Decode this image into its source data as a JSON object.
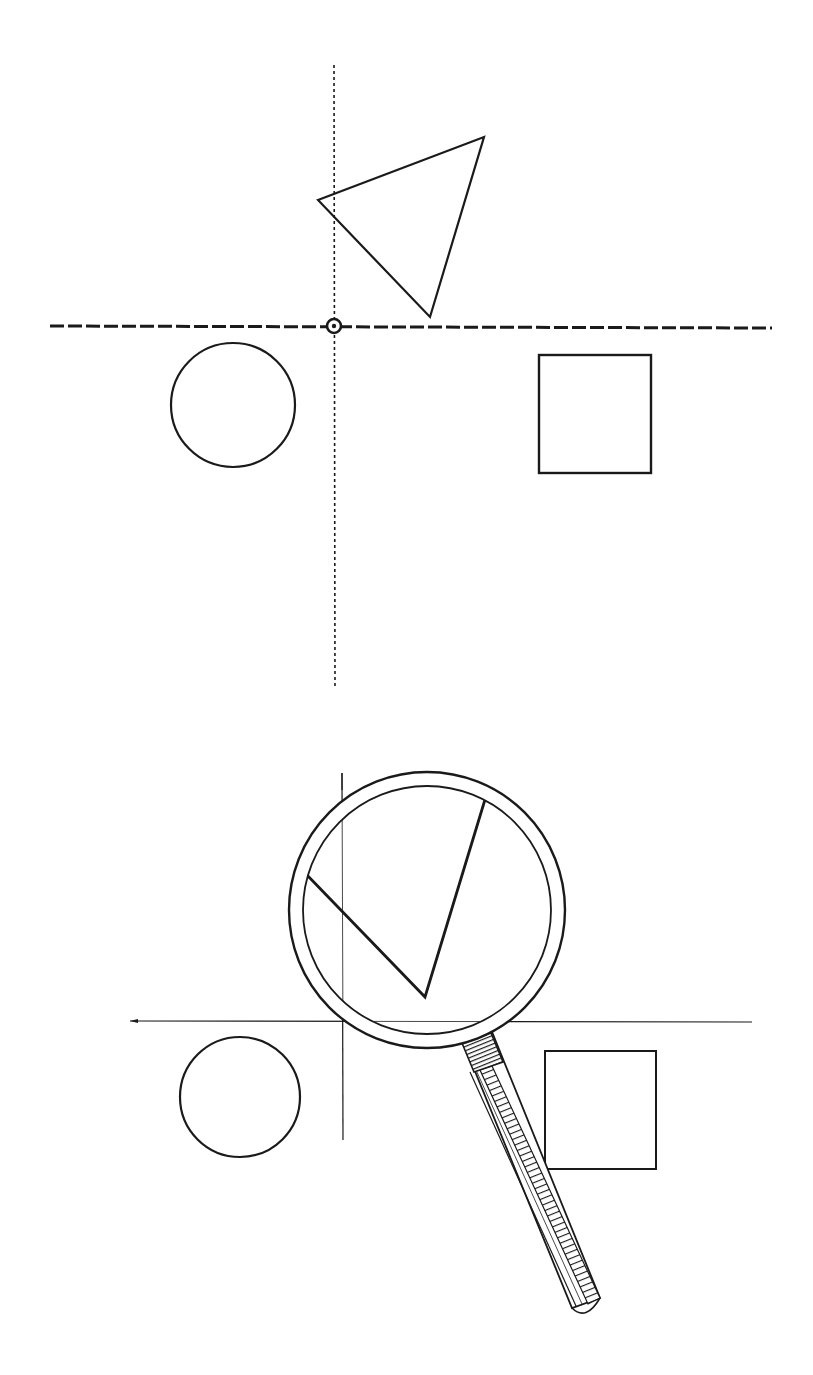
{
  "figure": {
    "width": 813,
    "height": 1375,
    "ink_color": "#1a1a1a",
    "background": "#ffffff",
    "panels": [
      {
        "id": "top",
        "description": "shapes arranged around dashed crosshair with marked origin",
        "horizontal_axis": {
          "x1": 50,
          "x2": 772,
          "y": 327,
          "style": "dashed"
        },
        "vertical_axis": {
          "x": 334,
          "y1": 65,
          "y2": 688,
          "style": "dotted"
        },
        "origin_marker": {
          "cx": 334,
          "cy": 326,
          "r": 7
        },
        "triangle": [
          [
            318,
            200
          ],
          [
            484,
            137
          ],
          [
            430,
            317
          ]
        ],
        "circle": {
          "cx": 233,
          "cy": 405,
          "r": 62
        },
        "square": {
          "x": 539,
          "y": 355,
          "w": 112,
          "h": 118
        }
      },
      {
        "id": "bottom",
        "description": "same arrangement with magnifying glass enlarging the triangle corner",
        "horizontal_axis": {
          "x1": 130,
          "x2": 752,
          "y": 1021,
          "style": "solid-thin"
        },
        "vertical_axis": {
          "x": 342,
          "y1": 773,
          "y2": 1140,
          "style": "solid-thin"
        },
        "magnifier": {
          "cx": 427,
          "cy": 910,
          "outer_r": 138,
          "inner_r": 124,
          "magnified_lines": [
            [
              306,
              874
            ],
            [
              425,
              997
            ],
            [
              487,
              793
            ]
          ],
          "handle": {
            "from": [
              478,
              1040
            ],
            "to": [
              580,
              1290
            ],
            "width": 30
          }
        },
        "circle": {
          "cx": 240,
          "cy": 1097,
          "r": 60
        },
        "square": {
          "x": 545,
          "y": 1051,
          "w": 111,
          "h": 118
        }
      }
    ]
  }
}
